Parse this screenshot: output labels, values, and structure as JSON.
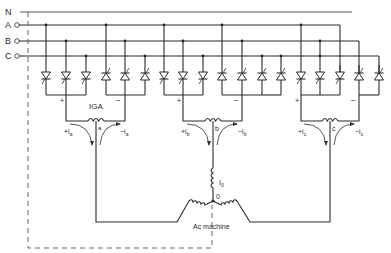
{
  "diagram": {
    "type": "circuit",
    "lines": [
      {
        "label": "N",
        "y": 12
      },
      {
        "label": "A",
        "y": 25
      },
      {
        "label": "B",
        "y": 41
      },
      {
        "label": "C",
        "y": 56
      }
    ],
    "groups": [
      {
        "phase": "a",
        "center_x": 96,
        "pos_label": "+",
        "neg_label": "−",
        "pos_current": "+i",
        "neg_current": "−i",
        "sub": "a",
        "tap": "a",
        "reactor_label": "IGA"
      },
      {
        "phase": "b",
        "center_x": 213,
        "pos_label": "+",
        "neg_label": "−",
        "pos_current": "+i",
        "neg_current": "−i",
        "sub": "b",
        "tap": "b",
        "reactor_label": ""
      },
      {
        "phase": "c",
        "center_x": 330,
        "pos_label": "+",
        "neg_label": "−",
        "pos_current": "+i",
        "neg_current": "−i",
        "sub": "c",
        "tap": "c",
        "reactor_label": ""
      }
    ],
    "machine": {
      "label": "Ac machine",
      "neutral_label": "0",
      "current_label": "I",
      "current_sub": "0"
    }
  }
}
